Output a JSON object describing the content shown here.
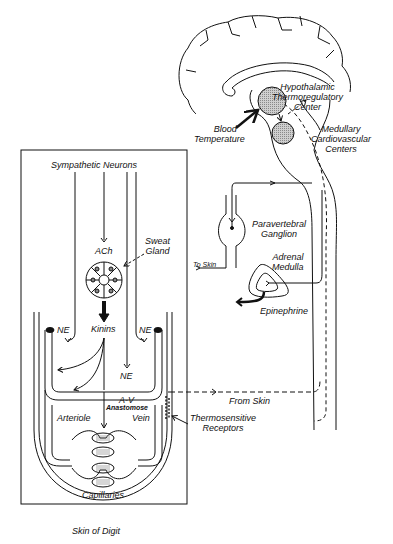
{
  "diagram": {
    "caption": "Skin of Digit",
    "brain": {
      "hypothalamic_center": [
        "Hypothalamic",
        "Thermoregulatory",
        "Center"
      ],
      "medullary_centers": [
        "Medullary",
        "Cardiovascular",
        "Centers"
      ],
      "blood_temperature": [
        "Blood",
        "Temperature"
      ]
    },
    "spinal": {
      "paravertebral_ganglion": [
        "Paravertebral",
        "Ganglion"
      ],
      "adrenal_medulla": [
        "Adrenal",
        "Medulla"
      ],
      "epinephrine": "Epinephrine",
      "to_skin": "To Skin",
      "from_skin": "From Skin",
      "thermosensitive_receptors": [
        "Thermosensitive",
        "Receptors"
      ]
    },
    "digit": {
      "sympathetic_neurons": "Sympathetic Neurons",
      "sweat_gland": [
        "Sweat",
        "Gland"
      ],
      "ach": "ACh",
      "kinins": "Kinins",
      "ne_left": "NE",
      "ne_right": "NE",
      "ne_center": "NE",
      "av": "A-V",
      "anastomose": "Anastomose",
      "arteriole": "Arteriole",
      "vein": "Vein",
      "capillaries": "Capillaries"
    }
  }
}
